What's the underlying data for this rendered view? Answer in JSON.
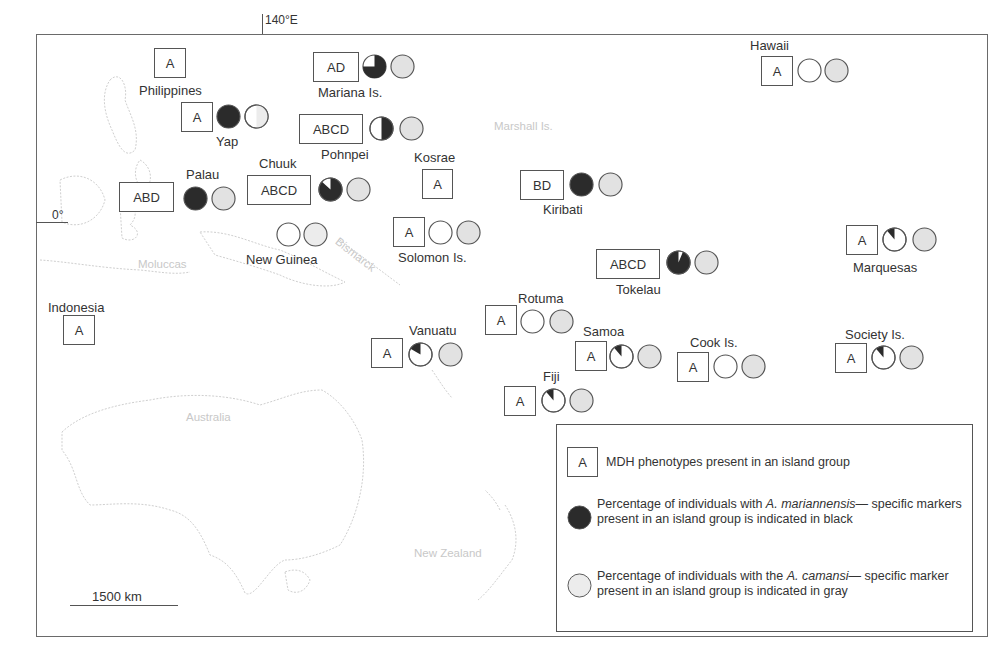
{
  "map": {
    "meridian_label": "140°E",
    "equator_label": "0°",
    "scale_label": "1500 km",
    "background_labels": {
      "moluccas": "Moluccas",
      "bismarck": "Bismarck",
      "marshall": "Marshall Is.",
      "australia": "Australia",
      "new_zealand": "New Zealand"
    },
    "colors": {
      "black_marker": "#2b2b2b",
      "gray_marker": "#e2e2e2",
      "outline": "#555555"
    }
  },
  "islands": [
    {
      "name": "Philippines",
      "mdh": "A",
      "black_pct": null,
      "gray_pct": null
    },
    {
      "name": "Mariana Is.",
      "mdh": "AD",
      "black_pct": 75,
      "gray_pct": 100
    },
    {
      "name": "Yap",
      "mdh": "A",
      "black_pct": 100,
      "gray_pct": 50
    },
    {
      "name": "Pohnpei",
      "mdh": "ABCD",
      "black_pct": 50,
      "gray_pct": 100
    },
    {
      "name": "Palau",
      "mdh": "ABD",
      "black_pct": 100,
      "gray_pct": 100
    },
    {
      "name": "Chuuk",
      "mdh": "ABCD",
      "black_pct": 85,
      "gray_pct": 100
    },
    {
      "name": "Kosrae",
      "mdh": "A",
      "black_pct": null,
      "gray_pct": null
    },
    {
      "name": "Kiribati",
      "mdh": "BD",
      "black_pct": 100,
      "gray_pct": 100
    },
    {
      "name": "Hawaii",
      "mdh": "A",
      "black_pct": 0,
      "gray_pct": 100
    },
    {
      "name": "New Guinea",
      "mdh": null,
      "black_pct": 0,
      "gray_pct": 100
    },
    {
      "name": "Solomon Is.",
      "mdh": "A",
      "black_pct": 0,
      "gray_pct": 100
    },
    {
      "name": "Tokelau",
      "mdh": "ABCD",
      "black_pct": 92,
      "gray_pct": 100
    },
    {
      "name": "Marquesas",
      "mdh": "A",
      "black_pct": 12,
      "gray_pct": 100
    },
    {
      "name": "Indonesia",
      "mdh": "A",
      "black_pct": null,
      "gray_pct": null
    },
    {
      "name": "Rotuma",
      "mdh": "A",
      "black_pct": 0,
      "gray_pct": 100
    },
    {
      "name": "Vanuatu",
      "mdh": "A",
      "black_pct": 17,
      "gray_pct": 100
    },
    {
      "name": "Samoa",
      "mdh": "A",
      "black_pct": 12,
      "gray_pct": 100
    },
    {
      "name": "Cook Is.",
      "mdh": "A",
      "black_pct": 0,
      "gray_pct": 100
    },
    {
      "name": "Society Is.",
      "mdh": "A",
      "black_pct": 12,
      "gray_pct": 100
    },
    {
      "name": "Fiji",
      "mdh": "A",
      "black_pct": 12,
      "gray_pct": 100
    }
  ],
  "legend": {
    "mdh_sample": "A",
    "mdh_text": "MDH phenotypes present in an island group",
    "black_text_1": "Percentage of individuals with ",
    "black_species": "A. mariannensis",
    "black_text_2": "— specific markers present in an island group is indicated in black",
    "gray_text_1": "Percentage of individuals with the ",
    "gray_species": "A. camansi",
    "gray_text_2": "— specific marker present in an island group is  indicated in gray"
  }
}
